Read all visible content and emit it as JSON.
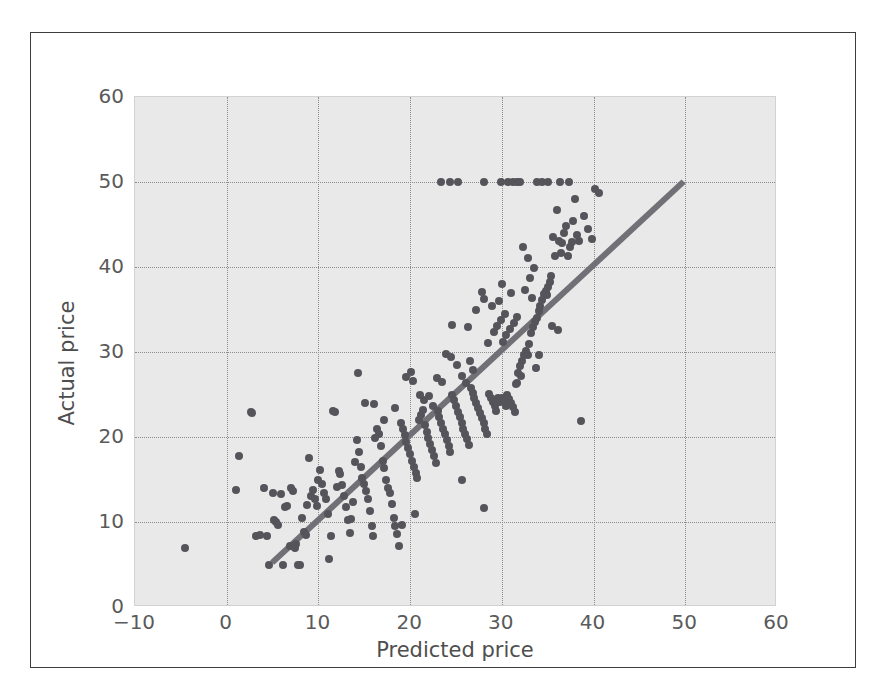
{
  "figure": {
    "background_color": "#ffffff",
    "frame_border_color": "#3d3d3d",
    "plot_background_color": "#e9e9e9",
    "gridline_color": "#8d8d8d",
    "marker_color": "#54545a",
    "reference_line_color": "#707076"
  },
  "chart_data": {
    "type": "scatter",
    "title": "",
    "xlabel": "Predicted price",
    "ylabel": "Actual price",
    "xlim": [
      -10,
      60
    ],
    "ylim": [
      0,
      60
    ],
    "xticks": [
      -10,
      0,
      10,
      20,
      30,
      40,
      50,
      60
    ],
    "yticks": [
      0,
      10,
      20,
      30,
      40,
      50,
      60
    ],
    "xtick_labels": [
      "−10",
      "0",
      "10",
      "20",
      "30",
      "40",
      "50",
      "60"
    ],
    "ytick_labels": [
      "0",
      "10",
      "20",
      "30",
      "40",
      "50",
      "60"
    ],
    "grid": true,
    "grid_style": "dotted",
    "legend": null,
    "legend_position": "none",
    "annotations": [],
    "series": [
      {
        "name": "Predicted vs actual price",
        "type": "scatter",
        "marker": "circle",
        "marker_size": 8,
        "color": "#54545a",
        "points": [
          [
            -4.5,
            7.0
          ],
          [
            1.3,
            17.8
          ],
          [
            1.0,
            13.8
          ],
          [
            2.6,
            23.0
          ],
          [
            2.8,
            22.8
          ],
          [
            3.2,
            8.4
          ],
          [
            3.6,
            8.5
          ],
          [
            4.1,
            14.0
          ],
          [
            4.4,
            8.3
          ],
          [
            4.6,
            5.0
          ],
          [
            5.0,
            13.4
          ],
          [
            5.2,
            10.2
          ],
          [
            5.4,
            10.0
          ],
          [
            5.6,
            9.6
          ],
          [
            5.9,
            13.3
          ],
          [
            6.1,
            5.0
          ],
          [
            6.4,
            11.8
          ],
          [
            6.6,
            11.9
          ],
          [
            6.9,
            7.2
          ],
          [
            7.0,
            14.0
          ],
          [
            7.2,
            13.6
          ],
          [
            7.4,
            7.0
          ],
          [
            7.6,
            7.4
          ],
          [
            7.8,
            5.0
          ],
          [
            8.0,
            5.0
          ],
          [
            8.2,
            10.5
          ],
          [
            8.4,
            8.8
          ],
          [
            8.6,
            8.5
          ],
          [
            8.8,
            12.0
          ],
          [
            9.0,
            17.5
          ],
          [
            9.2,
            13.1
          ],
          [
            9.4,
            13.8
          ],
          [
            9.6,
            12.7
          ],
          [
            9.8,
            11.9
          ],
          [
            10.0,
            15.0
          ],
          [
            10.2,
            16.1
          ],
          [
            10.4,
            14.5
          ],
          [
            10.6,
            13.4
          ],
          [
            10.8,
            12.7
          ],
          [
            11.0,
            11.0
          ],
          [
            11.2,
            5.6
          ],
          [
            11.4,
            8.3
          ],
          [
            11.6,
            23.1
          ],
          [
            11.8,
            22.9
          ],
          [
            12.0,
            14.1
          ],
          [
            12.2,
            16.0
          ],
          [
            12.4,
            15.6
          ],
          [
            12.6,
            14.4
          ],
          [
            12.8,
            13.1
          ],
          [
            13.0,
            11.8
          ],
          [
            13.2,
            10.2
          ],
          [
            13.4,
            8.7
          ],
          [
            13.6,
            10.4
          ],
          [
            13.8,
            12.3
          ],
          [
            14.0,
            17.1
          ],
          [
            14.2,
            19.6
          ],
          [
            14.4,
            18.2
          ],
          [
            14.6,
            16.5
          ],
          [
            14.8,
            15.2
          ],
          [
            15.0,
            14.5
          ],
          [
            15.2,
            13.6
          ],
          [
            15.4,
            12.7
          ],
          [
            15.6,
            11.3
          ],
          [
            15.8,
            9.5
          ],
          [
            16.0,
            8.4
          ],
          [
            14.3,
            27.5
          ],
          [
            16.2,
            19.9
          ],
          [
            16.4,
            21.0
          ],
          [
            16.6,
            20.4
          ],
          [
            16.8,
            18.9
          ],
          [
            17.0,
            17.2
          ],
          [
            17.2,
            16.3
          ],
          [
            17.4,
            15.0
          ],
          [
            17.6,
            14.0
          ],
          [
            17.8,
            13.4
          ],
          [
            18.0,
            12.1
          ],
          [
            18.2,
            10.5
          ],
          [
            18.4,
            9.5
          ],
          [
            18.6,
            8.6
          ],
          [
            18.8,
            7.2
          ],
          [
            19.0,
            21.6
          ],
          [
            19.2,
            20.9
          ],
          [
            19.4,
            20.2
          ],
          [
            19.6,
            19.4
          ],
          [
            19.8,
            18.7
          ],
          [
            20.0,
            18.0
          ],
          [
            20.2,
            17.2
          ],
          [
            20.4,
            16.5
          ],
          [
            20.6,
            15.8
          ],
          [
            20.8,
            15.2
          ],
          [
            21.0,
            22.0
          ],
          [
            21.2,
            22.6
          ],
          [
            21.4,
            23.2
          ],
          [
            21.6,
            21.4
          ],
          [
            21.8,
            20.6
          ],
          [
            22.0,
            19.9
          ],
          [
            22.2,
            19.2
          ],
          [
            22.4,
            18.5
          ],
          [
            22.6,
            17.8
          ],
          [
            22.8,
            17.0
          ],
          [
            19.5,
            27.1
          ],
          [
            20.1,
            27.6
          ],
          [
            20.3,
            26.6
          ],
          [
            21.1,
            25.0
          ],
          [
            21.5,
            24.4
          ],
          [
            22.1,
            24.8
          ],
          [
            22.5,
            23.7
          ],
          [
            23.0,
            23.1
          ],
          [
            23.2,
            22.4
          ],
          [
            23.4,
            21.7
          ],
          [
            23.6,
            21.0
          ],
          [
            23.8,
            20.3
          ],
          [
            24.0,
            19.6
          ],
          [
            24.2,
            18.9
          ],
          [
            24.4,
            18.2
          ],
          [
            24.6,
            25.0
          ],
          [
            24.8,
            24.3
          ],
          [
            25.0,
            23.6
          ],
          [
            25.2,
            23.0
          ],
          [
            25.4,
            22.3
          ],
          [
            25.6,
            21.6
          ],
          [
            25.8,
            21.0
          ],
          [
            26.0,
            20.4
          ],
          [
            26.2,
            19.8
          ],
          [
            26.4,
            19.1
          ],
          [
            23.9,
            29.8
          ],
          [
            24.5,
            29.4
          ],
          [
            25.1,
            28.5
          ],
          [
            25.7,
            27.2
          ],
          [
            26.1,
            26.4
          ],
          [
            26.6,
            25.8
          ],
          [
            26.8,
            25.2
          ],
          [
            27.0,
            24.6
          ],
          [
            27.2,
            24.0
          ],
          [
            27.4,
            23.4
          ],
          [
            27.6,
            22.8
          ],
          [
            27.8,
            22.2
          ],
          [
            28.0,
            21.6
          ],
          [
            28.2,
            21.0
          ],
          [
            28.4,
            20.4
          ],
          [
            28.6,
            25.1
          ],
          [
            28.8,
            24.6
          ],
          [
            29.0,
            24.1
          ],
          [
            29.2,
            23.6
          ],
          [
            29.4,
            23.1
          ],
          [
            29.6,
            24.6
          ],
          [
            29.8,
            24.1
          ],
          [
            30.0,
            24.6
          ],
          [
            30.2,
            24.1
          ],
          [
            30.4,
            23.6
          ],
          [
            30.6,
            25.0
          ],
          [
            30.8,
            24.5
          ],
          [
            31.0,
            24.0
          ],
          [
            31.2,
            23.5
          ],
          [
            31.4,
            23.0
          ],
          [
            31.6,
            26.4
          ],
          [
            31.8,
            27.5
          ],
          [
            32.0,
            28.4
          ],
          [
            32.2,
            29.0
          ],
          [
            32.4,
            29.6
          ],
          [
            30.1,
            31.2
          ],
          [
            30.5,
            32.0
          ],
          [
            30.9,
            32.7
          ],
          [
            31.3,
            33.4
          ],
          [
            31.7,
            34.1
          ],
          [
            28.5,
            31.1
          ],
          [
            29.1,
            32.4
          ],
          [
            29.5,
            33.1
          ],
          [
            29.9,
            33.8
          ],
          [
            30.3,
            34.5
          ],
          [
            28.1,
            36.2
          ],
          [
            28.9,
            35.4
          ],
          [
            29.7,
            36.0
          ],
          [
            32.6,
            30.1
          ],
          [
            32.8,
            29.7
          ],
          [
            33.0,
            31.0
          ],
          [
            33.2,
            32.2
          ],
          [
            33.4,
            33.0
          ],
          [
            33.6,
            33.5
          ],
          [
            33.8,
            34.0
          ],
          [
            34.0,
            34.8
          ],
          [
            34.2,
            35.4
          ],
          [
            34.4,
            36.1
          ],
          [
            34.6,
            36.8
          ],
          [
            34.8,
            37.2
          ],
          [
            33.1,
            38.7
          ],
          [
            33.5,
            39.9
          ],
          [
            32.9,
            41.1
          ],
          [
            32.3,
            42.3
          ],
          [
            35.0,
            37.6
          ],
          [
            35.2,
            38.2
          ],
          [
            35.4,
            38.9
          ],
          [
            35.6,
            43.5
          ],
          [
            35.8,
            41.3
          ],
          [
            36.0,
            46.7
          ],
          [
            36.2,
            43.1
          ],
          [
            36.4,
            41.7
          ],
          [
            36.6,
            42.8
          ],
          [
            36.8,
            44.0
          ],
          [
            37.0,
            44.8
          ],
          [
            37.2,
            41.3
          ],
          [
            37.4,
            42.3
          ],
          [
            37.6,
            43.0
          ],
          [
            37.8,
            45.4
          ],
          [
            38.0,
            48.0
          ],
          [
            38.2,
            43.8
          ],
          [
            38.4,
            43.1
          ],
          [
            38.6,
            21.9
          ],
          [
            39.0,
            46.0
          ],
          [
            39.4,
            44.5
          ],
          [
            39.8,
            43.3
          ],
          [
            40.2,
            49.2
          ],
          [
            40.6,
            48.7
          ],
          [
            23.4,
            50.0
          ],
          [
            24.3,
            50.0
          ],
          [
            25.2,
            50.0
          ],
          [
            28.0,
            50.0
          ],
          [
            29.9,
            50.0
          ],
          [
            30.7,
            50.0
          ],
          [
            31.2,
            50.0
          ],
          [
            31.7,
            50.0
          ],
          [
            32.0,
            50.0
          ],
          [
            33.8,
            50.0
          ],
          [
            34.4,
            50.0
          ],
          [
            35.0,
            50.0
          ],
          [
            36.3,
            50.0
          ],
          [
            37.3,
            50.0
          ],
          [
            25.6,
            14.9
          ],
          [
            28.1,
            11.6
          ],
          [
            26.3,
            33.0
          ],
          [
            24.6,
            33.2
          ],
          [
            27.2,
            35.0
          ],
          [
            27.8,
            37.1
          ],
          [
            30.0,
            38.0
          ],
          [
            31.0,
            36.9
          ],
          [
            32.5,
            37.3
          ],
          [
            33.3,
            36.4
          ],
          [
            34.9,
            36.7
          ],
          [
            35.5,
            33.1
          ],
          [
            36.1,
            32.6
          ],
          [
            34.1,
            29.6
          ],
          [
            33.7,
            28.1
          ],
          [
            32.1,
            27.2
          ],
          [
            31.5,
            26.2
          ],
          [
            20.5,
            10.9
          ],
          [
            19.1,
            9.7
          ],
          [
            17.1,
            22.0
          ],
          [
            18.3,
            23.4
          ],
          [
            16.1,
            23.9
          ],
          [
            15.1,
            24.0
          ],
          [
            23.5,
            26.5
          ],
          [
            22.9,
            27.0
          ],
          [
            26.9,
            27.9
          ],
          [
            26.5,
            28.9
          ]
        ]
      },
      {
        "name": "y = x reference line",
        "type": "line",
        "color": "#707076",
        "linewidth": 6,
        "points": [
          [
            5,
            5
          ],
          [
            50,
            50
          ]
        ]
      }
    ]
  }
}
